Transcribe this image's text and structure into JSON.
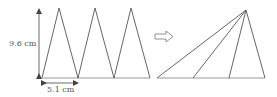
{
  "diagram": {
    "left_figure": {
      "description": "Three congruent isosceles triangles side by side",
      "height_label": "9.6 cm",
      "base_label": "5.1 cm",
      "triangle_count": 3
    },
    "transform_arrow": "right-hollow-arrow",
    "right_figure": {
      "description": "Triangles sheared to share a common apex, forming one large triangle",
      "triangle_count": 3
    },
    "colors": {
      "line": "#555555",
      "baseline": "#999999"
    }
  }
}
